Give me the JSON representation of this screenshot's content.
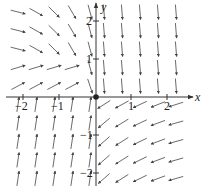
{
  "figure": {
    "type": "direction_field",
    "axis_labels": {
      "x": "x",
      "y": "y"
    },
    "x_ticks": [
      {
        "value": -2,
        "label": "−2"
      },
      {
        "value": -1,
        "label": "−1"
      },
      {
        "value": 1,
        "label": "1"
      },
      {
        "value": 2,
        "label": "2"
      }
    ],
    "y_ticks": [
      {
        "value": 2,
        "label": "2"
      },
      {
        "value": 1,
        "label": "1"
      },
      {
        "value": -1,
        "label": "−1"
      },
      {
        "value": -2,
        "label": "−2"
      }
    ],
    "xlim": [
      -2.4,
      2.6
    ],
    "ylim": [
      -2.5,
      2.5
    ],
    "equilibrium_point": {
      "x": 0,
      "y": 0
    },
    "colors": {
      "axis": "#333333",
      "arrow": "#444444",
      "background": "#ffffff"
    },
    "quadrant_behavior": {
      "upper_left": "arrows sweep right then curve down toward the y-axis",
      "upper_right": "arrows point nearly straight down",
      "lower_left": "arrows point up, slightly to the right",
      "lower_right": "arrows point left and slightly down, curving toward the y-axis"
    }
  }
}
